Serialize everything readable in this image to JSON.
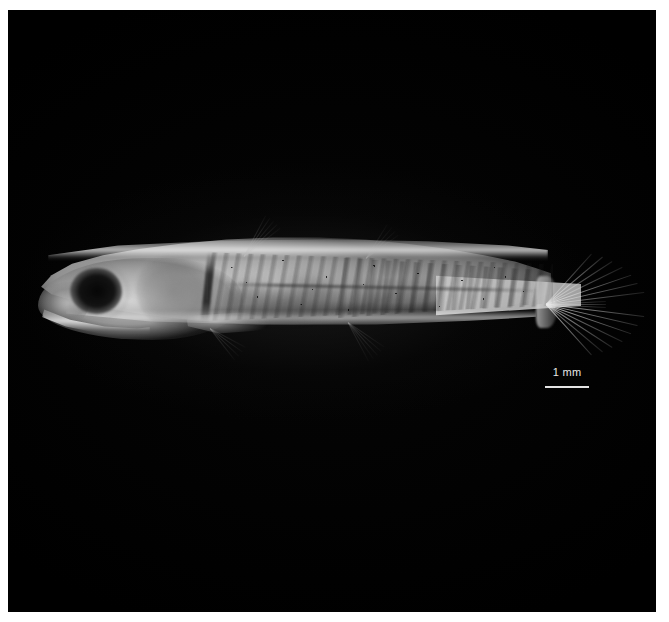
{
  "image": {
    "kind": "specimen-photograph",
    "subject": "fish",
    "view": "lateral",
    "orientation": "head-left",
    "background_color": "#000000",
    "frame_color": "#ffffff"
  },
  "scale_bar": {
    "label": "1 mm",
    "value": 1,
    "unit": "mm",
    "bar_color": "#e3e3e3",
    "text_color": "#e8e8e8"
  },
  "anatomy": {
    "eye": "eye",
    "snout": "snout",
    "jaw": "lower-jaw",
    "opercle": "opercle",
    "gut": "gut-region",
    "swim_bladder": "swim-bladder",
    "lateral_line": "lateral-line",
    "myomeres": "myomere-banding",
    "melanophores": "melanophore-speckling",
    "caudal_fin": "caudal-fin",
    "dorsal_fin": "dorsal-fin",
    "anal_fin": "anal-fin",
    "pelvic_fin": "pelvic-fin",
    "pectoral_fin": "pectoral-fin",
    "caudal_peduncle": "caudal-peduncle"
  },
  "fin_rays": {
    "caudal_upper": [
      -48,
      -40,
      -33,
      -26,
      -19,
      -13,
      -7
    ],
    "caudal_lower": [
      7,
      13,
      19,
      26,
      33,
      40,
      48
    ],
    "caudal_middle": [
      -3,
      0,
      3
    ],
    "dorsal": [
      -62,
      -56,
      -50,
      -44,
      -38
    ],
    "dorsal_2": [
      -58,
      -50,
      -43,
      -36
    ],
    "anal": [
      34,
      41,
      48,
      55,
      62
    ],
    "pelvic": [
      28,
      36,
      44,
      52
    ]
  }
}
